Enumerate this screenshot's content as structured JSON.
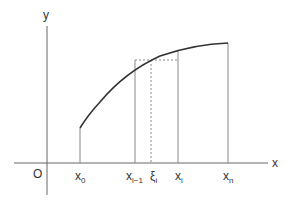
{
  "diagram": {
    "axes": {
      "x_label": "x",
      "y_label": "y",
      "origin_label": "O"
    },
    "ticks": [
      {
        "base": "x",
        "sub": "0"
      },
      {
        "base": "x",
        "sub": "i−1"
      },
      {
        "base": "ξ",
        "sub": "i"
      },
      {
        "base": "x",
        "sub": "i"
      },
      {
        "base": "x",
        "sub": "n"
      }
    ],
    "colors": {
      "line": "#555555",
      "curve": "#333333",
      "dashed": "#888888"
    }
  }
}
